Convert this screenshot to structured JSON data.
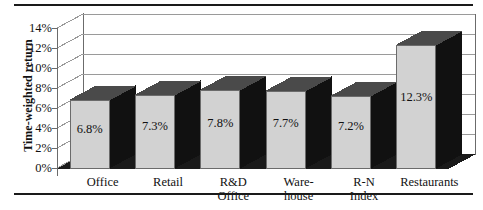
{
  "chart_data": {
    "type": "bar",
    "title": "",
    "subtitle": "",
    "xlabel": "",
    "ylabel": "Time-weighted return",
    "categories": [
      "Office",
      "Retail",
      "R&D Office",
      "Warehouse",
      "R-N Index",
      "Restaurants"
    ],
    "category_lines": [
      [
        "Office",
        ""
      ],
      [
        "Retail",
        ""
      ],
      [
        "R&D",
        "Office"
      ],
      [
        "Ware-",
        "house"
      ],
      [
        "R-N",
        "Index"
      ],
      [
        "Restaurants",
        ""
      ]
    ],
    "values": [
      6.8,
      7.3,
      7.8,
      7.7,
      7.2,
      12.3
    ],
    "value_labels": [
      "6.8%",
      "7.3%",
      "7.8%",
      "7.7%",
      "7.2%",
      "12.3%"
    ],
    "ylim": [
      0,
      14
    ],
    "ytick_values": [
      0,
      2,
      4,
      6,
      8,
      10,
      12,
      14
    ],
    "ytick_labels": [
      "0%",
      "2%",
      "4%",
      "6%",
      "8%",
      "10%",
      "12%",
      "14%"
    ],
    "grid": true,
    "grid_axis": "y",
    "legend": false,
    "legend_position": "none",
    "three_d": true,
    "colors": {
      "bar_front": "#d2d2d2",
      "bar_top": "#4a4a4a",
      "bar_side": "#111111",
      "floor": "#1a1a1a",
      "wall": "#ffffff",
      "gridline": "#9a9a9a",
      "frame": "#6b6b6b",
      "axis": "#6b6b6b",
      "text": "#111111",
      "rule": "#1a1a1a"
    }
  }
}
